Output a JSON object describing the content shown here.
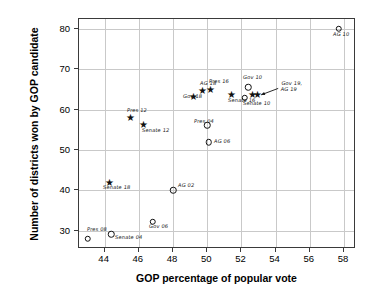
{
  "chart_data": {
    "type": "scatter",
    "title": "",
    "xlabel": "GOP percentage of popular vote",
    "ylabel": "Number of districts won by GOP candidate",
    "xlim": [
      42.5,
      58.7
    ],
    "ylim": [
      25.5,
      82.5
    ],
    "xticks": [
      44,
      46,
      48,
      50,
      52,
      54,
      56,
      58
    ],
    "yticks": [
      30,
      40,
      50,
      60,
      70,
      80
    ],
    "grid": true,
    "legend": "none",
    "points": [
      {
        "label": "Pres 08",
        "x": 43.0,
        "y": 28.0,
        "marker": "circle",
        "label_dx": -1,
        "label_dy": -9
      },
      {
        "label": "Senate 04",
        "x": 44.4,
        "y": 29.2,
        "marker": "circle",
        "label_dx": 4,
        "label_dy": 4
      },
      {
        "label": "Gov 06",
        "x": 46.8,
        "y": 32.2,
        "marker": "circle",
        "label_dx": -4,
        "label_dy": 5
      },
      {
        "label": "Senate 18",
        "x": 44.3,
        "y": 41.6,
        "marker": "star",
        "label_dx": -7,
        "label_dy": 4
      },
      {
        "label": "AG 02",
        "x": 48.0,
        "y": 40.0,
        "marker": "circle",
        "label_dx": 5,
        "label_dy": -4
      },
      {
        "label": "AG 06",
        "x": 50.1,
        "y": 52.0,
        "marker": "circle",
        "label_dx": 5,
        "label_dy": 0
      },
      {
        "label": "Pres 12",
        "x": 45.5,
        "y": 57.6,
        "marker": "star",
        "label_dx": -3,
        "label_dy": -8
      },
      {
        "label": "Senate 12",
        "x": 46.3,
        "y": 56.0,
        "marker": "star",
        "label_dx": -2,
        "label_dy": 5
      },
      {
        "label": "Pres 04",
        "x": 50.0,
        "y": 56.2,
        "marker": "circle",
        "label_dx": -13,
        "label_dy": -3
      },
      {
        "label": "Gov 18",
        "x": 49.2,
        "y": 62.8,
        "marker": "star",
        "label_dx": -11,
        "label_dy": -1
      },
      {
        "label": "AG 18",
        "x": 49.7,
        "y": 64.3,
        "marker": "star",
        "label_dx": -2,
        "label_dy": -8
      },
      {
        "label": "Pres 16",
        "x": 50.2,
        "y": 64.6,
        "marker": "star",
        "label_dx": -2,
        "label_dy": -9
      },
      {
        "label": "Senate 16",
        "x": 51.4,
        "y": 63.4,
        "marker": "star",
        "label_dx": -3,
        "label_dy": 5
      },
      {
        "label": "Gov 10",
        "x": 52.4,
        "y": 65.6,
        "marker": "circle",
        "label_dx": -5,
        "label_dy": -9
      },
      {
        "label": "Senate 10",
        "x": 52.2,
        "y": 63.0,
        "marker": "circle",
        "label_dx": -2,
        "label_dy": 6
      },
      {
        "label": "",
        "x": 52.65,
        "y": 63.4,
        "marker": "star",
        "label_dx": 0,
        "label_dy": 0
      },
      {
        "label": "",
        "x": 52.95,
        "y": 63.5,
        "marker": "star",
        "label_dx": 0,
        "label_dy": 0
      },
      {
        "label": "AG 10",
        "x": 57.7,
        "y": 80.1,
        "marker": "circle",
        "label_dx": -6,
        "label_dy": 6
      }
    ],
    "annotations": [
      {
        "text": "Gov 19,\nAG 19",
        "text_x": 54.3,
        "text_y": 66.3,
        "arrow_from_x": 54.15,
        "arrow_from_y": 65.3,
        "arrow_to_x": 53.15,
        "arrow_to_y": 63.7
      }
    ]
  },
  "colors": {
    "marker": "#111111",
    "frame": "#3a3a3a",
    "grid": "#c9c9c9",
    "text": "#000000",
    "background": "#ffffff"
  }
}
